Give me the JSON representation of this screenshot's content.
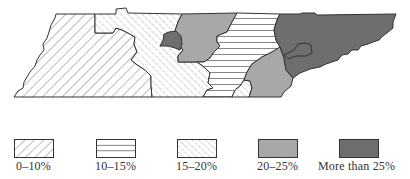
{
  "map": {
    "subject": "Tennessee regions",
    "regions": [
      {
        "id": "west",
        "category": "0–10%"
      },
      {
        "id": "middle-west",
        "category": "15–20%"
      },
      {
        "id": "middle-pocket",
        "category": "More than 25%"
      },
      {
        "id": "middle-north",
        "category": "20–25%"
      },
      {
        "id": "middle-east",
        "category": "10–15%"
      },
      {
        "id": "southeast-wedge",
        "category": "15–20%"
      },
      {
        "id": "southeast",
        "category": "20–25%"
      },
      {
        "id": "east",
        "category": "More than 25%"
      }
    ]
  },
  "legend": {
    "items": [
      {
        "label": "0–10%",
        "pattern": "wide-diagonal-hatch"
      },
      {
        "label": "10–15%",
        "pattern": "horizontal-lines"
      },
      {
        "label": "15–20%",
        "pattern": "fine-diagonal-hatch"
      },
      {
        "label": "20–25%",
        "pattern": "light-gray-fill",
        "color": "#a8a8a8"
      },
      {
        "label": "More than 25%",
        "pattern": "dark-gray-fill",
        "color": "#6e6e6e"
      }
    ]
  }
}
